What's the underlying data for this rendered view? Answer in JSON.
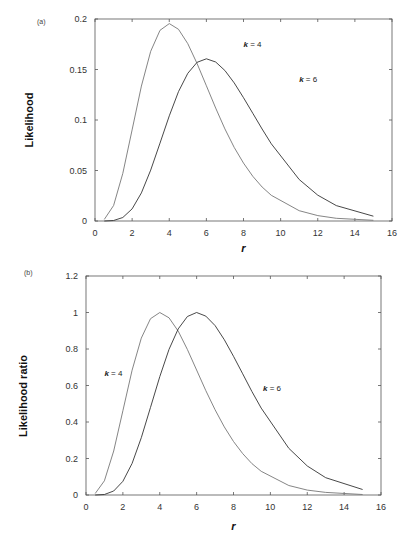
{
  "chart_data": [
    {
      "type": "line",
      "panel_label": "(a)",
      "title": "",
      "xlabel": "r",
      "ylabel": "Likelihood",
      "xlim": [
        0,
        16
      ],
      "ylim": [
        0,
        0.2
      ],
      "xticks": [
        0,
        2,
        4,
        6,
        8,
        10,
        12,
        14,
        16
      ],
      "yticks": [
        0,
        0.05,
        0.1,
        0.15,
        0.2
      ],
      "ytick_labels": [
        "0",
        "0.05",
        "0.1",
        "0.15",
        "0.2"
      ],
      "grid": false,
      "legend": "none",
      "x": [
        0.5,
        1,
        1.5,
        2,
        2.5,
        3,
        3.5,
        4,
        4.5,
        5,
        5.5,
        6,
        6.5,
        7,
        7.5,
        8,
        8.5,
        9,
        9.5,
        11,
        12,
        13,
        15
      ],
      "series": [
        {
          "name": "k = 4",
          "color": "#777777",
          "values": [
            0.0016,
            0.0153,
            0.0471,
            0.0902,
            0.1336,
            0.168,
            0.1888,
            0.1954,
            0.1898,
            0.1755,
            0.1558,
            0.1339,
            0.1118,
            0.0912,
            0.0729,
            0.0573,
            0.0443,
            0.0337,
            0.0254,
            0.0102,
            0.0053,
            0.0027,
            0.0007
          ]
        },
        {
          "name": "k = 6",
          "color": "#333333",
          "values": [
            0.0,
            0.0005,
            0.0035,
            0.012,
            0.0278,
            0.0504,
            0.0771,
            0.1042,
            0.1281,
            0.1462,
            0.1571,
            0.1606,
            0.1574,
            0.149,
            0.1367,
            0.1221,
            0.1066,
            0.0911,
            0.0764,
            0.0411,
            0.0255,
            0.0152,
            0.0048
          ]
        }
      ],
      "annotations": [
        {
          "text": "k = 4",
          "x": 8.0,
          "y": 0.172
        },
        {
          "text": "k = 6",
          "x": 11.0,
          "y": 0.138
        }
      ]
    },
    {
      "type": "line",
      "panel_label": "(b)",
      "title": "",
      "xlabel": "r",
      "ylabel": "Likelihood ratio",
      "xlim": [
        0,
        16
      ],
      "ylim": [
        0,
        1.2
      ],
      "xticks": [
        0,
        2,
        4,
        6,
        8,
        10,
        12,
        14,
        16
      ],
      "yticks": [
        0,
        0.2,
        0.4,
        0.6,
        0.8,
        1,
        1.2
      ],
      "ytick_labels": [
        "0",
        "0.2",
        "0.4",
        "0.6",
        "0.8",
        "1",
        "1.2"
      ],
      "grid": false,
      "legend": "none",
      "x": [
        0.5,
        1,
        1.5,
        2,
        2.5,
        3,
        3.5,
        4,
        4.5,
        5,
        5.5,
        6,
        6.5,
        7,
        7.5,
        8,
        8.5,
        9,
        9.5,
        11,
        12,
        13,
        15
      ],
      "series": [
        {
          "name": "k = 4",
          "color": "#777777",
          "values": [
            0.008,
            0.078,
            0.241,
            0.462,
            0.684,
            0.86,
            0.966,
            1.0,
            0.971,
            0.898,
            0.797,
            0.685,
            0.572,
            0.467,
            0.373,
            0.293,
            0.227,
            0.172,
            0.13,
            0.052,
            0.027,
            0.014,
            0.003
          ]
        },
        {
          "name": "k = 6",
          "color": "#333333",
          "values": [
            0.0001,
            0.003,
            0.022,
            0.075,
            0.173,
            0.314,
            0.48,
            0.649,
            0.798,
            0.91,
            0.978,
            1.0,
            0.98,
            0.928,
            0.851,
            0.76,
            0.664,
            0.567,
            0.476,
            0.256,
            0.159,
            0.095,
            0.03
          ]
        }
      ],
      "annotations": [
        {
          "text": "k = 4",
          "x": 1.0,
          "y": 0.65
        },
        {
          "text": "k = 6",
          "x": 9.6,
          "y": 0.57
        }
      ]
    }
  ]
}
